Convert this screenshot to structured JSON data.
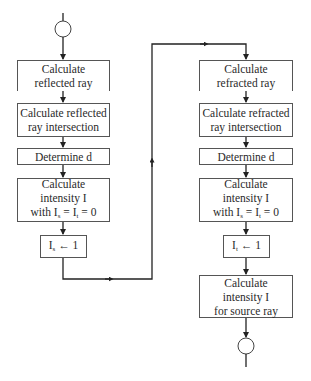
{
  "diagram": {
    "type": "flowchart",
    "left_column": {
      "boxes": [
        {
          "id": "L1",
          "lines": [
            "Calculate",
            "reflected  ray"
          ]
        },
        {
          "id": "L2",
          "lines": [
            "Calculate reflected",
            "ray intersection"
          ]
        },
        {
          "id": "L3",
          "lines": [
            "Determine d"
          ]
        },
        {
          "id": "L4",
          "lines": [
            "Calculate",
            "intensity I",
            "with I",
            "s",
            " = I",
            "t",
            " = 0"
          ]
        },
        {
          "id": "L5",
          "lines": [
            "I",
            "s",
            " ← 1"
          ]
        }
      ]
    },
    "right_column": {
      "boxes": [
        {
          "id": "R1",
          "lines": [
            "Calculate",
            "refracted  ray"
          ]
        },
        {
          "id": "R2",
          "lines": [
            "Calculate refracted",
            "ray intersection"
          ]
        },
        {
          "id": "R3",
          "lines": [
            "Determine d"
          ]
        },
        {
          "id": "R4",
          "lines": [
            "Calculate",
            "intensity I",
            "with I",
            "s",
            " = I",
            "t",
            " = 0"
          ]
        },
        {
          "id": "R5",
          "lines": [
            "I",
            "t",
            " ← 1"
          ]
        },
        {
          "id": "R6",
          "lines": [
            "Calculate",
            "intensity I",
            "for source ray"
          ]
        }
      ]
    },
    "terminals": [
      "start-connector-circle",
      "end-connector-circle"
    ],
    "edges": [
      [
        "start",
        "L1"
      ],
      [
        "L1",
        "L2"
      ],
      [
        "L2",
        "L3"
      ],
      [
        "L3",
        "L4"
      ],
      [
        "L4",
        "L5"
      ],
      [
        "L5",
        "R1"
      ],
      [
        "R1",
        "R2"
      ],
      [
        "R2",
        "R3"
      ],
      [
        "R3",
        "R4"
      ],
      [
        "R4",
        "R5"
      ],
      [
        "R5",
        "R6"
      ],
      [
        "R6",
        "end"
      ]
    ]
  }
}
